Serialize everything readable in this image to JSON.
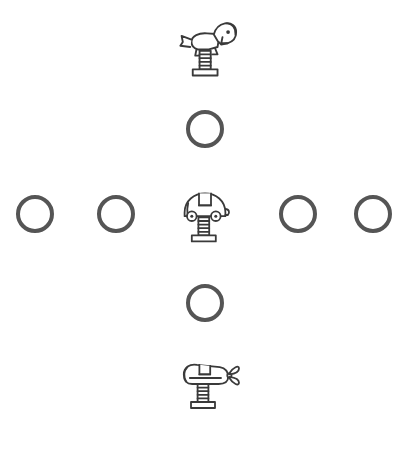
{
  "canvas": {
    "width": 407,
    "height": 451,
    "background_color": "#ffffff"
  },
  "style": {
    "ring_stroke_color": "#555555",
    "ring_stroke_width": 4,
    "icon_stroke_color": "#3a3a3a",
    "icon_fill_color": "#ffffff"
  },
  "layout": {
    "arrangement": "plus-cross",
    "center_x": 205,
    "center_y": 214,
    "row_y": 214,
    "column_x": 205
  },
  "items": [
    {
      "id": "rider-horse-top",
      "name": "horse-spring-rider-icon",
      "kind": "spring-rider",
      "shape": "horse",
      "label": "Horse Spring Rider",
      "x": 172,
      "y": 16,
      "width": 70,
      "height": 62,
      "position": "top"
    },
    {
      "id": "circle-top",
      "name": "circle-outline",
      "kind": "circle",
      "shape": "ring",
      "label": "Circle",
      "x": 186,
      "y": 110,
      "width": 38,
      "height": 38,
      "position": "upper-center"
    },
    {
      "id": "circle-far-left",
      "name": "circle-outline",
      "kind": "circle",
      "shape": "ring",
      "label": "Circle",
      "x": 16,
      "y": 195,
      "width": 38,
      "height": 38,
      "position": "row-left-1"
    },
    {
      "id": "circle-left",
      "name": "circle-outline",
      "kind": "circle",
      "shape": "ring",
      "label": "Circle",
      "x": 97,
      "y": 195,
      "width": 38,
      "height": 38,
      "position": "row-left-2"
    },
    {
      "id": "rider-car-center",
      "name": "car-spring-rider-icon",
      "kind": "spring-rider",
      "shape": "car",
      "label": "Car Spring Rider",
      "x": 174,
      "y": 185,
      "width": 62,
      "height": 60,
      "position": "center"
    },
    {
      "id": "circle-right",
      "name": "circle-outline",
      "kind": "circle",
      "shape": "ring",
      "label": "Circle",
      "x": 279,
      "y": 195,
      "width": 38,
      "height": 38,
      "position": "row-right-1"
    },
    {
      "id": "circle-far-right",
      "name": "circle-outline",
      "kind": "circle",
      "shape": "ring",
      "label": "Circle",
      "x": 354,
      "y": 195,
      "width": 38,
      "height": 38,
      "position": "row-right-2"
    },
    {
      "id": "circle-bottom",
      "name": "circle-outline",
      "kind": "circle",
      "shape": "ring",
      "label": "Circle",
      "x": 186,
      "y": 284,
      "width": 38,
      "height": 38,
      "position": "lower-center"
    },
    {
      "id": "rider-plane-bottom",
      "name": "airplane-spring-rider-icon",
      "kind": "spring-rider",
      "shape": "airplane",
      "label": "Airplane Spring Rider",
      "x": 174,
      "y": 354,
      "width": 70,
      "height": 60,
      "position": "bottom"
    }
  ]
}
